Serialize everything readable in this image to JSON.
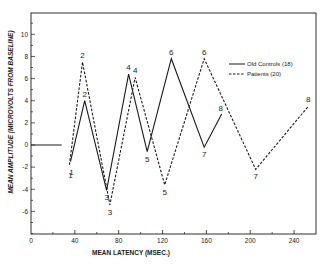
{
  "chart_data": {
    "type": "line",
    "title": "",
    "xlabel": "MEAN LATENCY (MSEC.)",
    "ylabel": "MEAN AMPLITUDE (MICROVOLTS FROM BASELINE)",
    "xlim": [
      0,
      260
    ],
    "ylim": [
      -8,
      12
    ],
    "x_ticks": [
      0,
      40,
      80,
      120,
      160,
      200,
      240
    ],
    "x_tick_labels": [
      "0",
      "40",
      "80",
      "120",
      "160",
      "200",
      "240"
    ],
    "x_minor_ticks": [
      20,
      60,
      100,
      140,
      180,
      220
    ],
    "y_ticks": [
      -6,
      -4,
      -2,
      0,
      2,
      4,
      6,
      8,
      10
    ],
    "y_tick_labels": [
      "-6",
      "-4",
      "-2",
      "0",
      "2",
      "4",
      "6",
      "8",
      "10"
    ],
    "grid": false,
    "legend_position": "upper right",
    "baseline": {
      "x": [
        0,
        28
      ],
      "y": [
        0,
        0
      ]
    },
    "series": [
      {
        "name": "Old Controls (18)",
        "style": "solid",
        "point_labels": [
          "1",
          "2",
          "3",
          "4",
          "5",
          "6",
          "7",
          "8"
        ],
        "x": [
          36,
          49,
          69,
          89,
          106,
          128,
          158,
          174
        ],
        "y": [
          -1.5,
          4.0,
          -4.1,
          6.4,
          -0.6,
          7.8,
          -0.2,
          2.8
        ]
      },
      {
        "name": "Patients (20)",
        "style": "dashed",
        "point_labels": [
          "1",
          "2",
          "3",
          "4",
          "5",
          "6",
          "7",
          "8"
        ],
        "x": [
          35,
          47,
          72,
          95,
          122,
          158,
          205,
          253
        ],
        "y": [
          -1.8,
          7.5,
          -5.4,
          6.1,
          -3.6,
          7.8,
          -2.2,
          3.5
        ]
      }
    ]
  },
  "legend": {
    "items": [
      {
        "label": "Old Controls (18)",
        "style": "solid"
      },
      {
        "label": "Patients (20)",
        "style": "dashed"
      }
    ]
  },
  "colors": {
    "ink": "#1a1a1a",
    "background": "#ffffff"
  }
}
